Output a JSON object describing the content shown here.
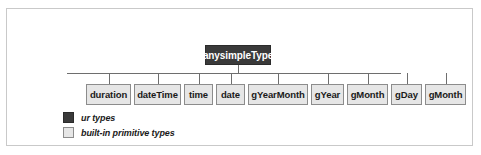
{
  "figure": {
    "frame_color": "#c9c9c9",
    "line_color": "#6e6e6e"
  },
  "tree": {
    "root": {
      "label": "anysimpleType",
      "fill": "#3a3a3a",
      "text_color": "#ffffff",
      "x": 205,
      "width": 66
    },
    "children": [
      {
        "label": "duration",
        "x": 86,
        "width": 45
      },
      {
        "label": "dateTime",
        "x": 134,
        "width": 47
      },
      {
        "label": "time",
        "x": 184,
        "width": 29
      },
      {
        "label": "date",
        "x": 216,
        "width": 29
      },
      {
        "label": "gYearMonth",
        "x": 248,
        "width": 60
      },
      {
        "label": "gYear",
        "x": 311,
        "width": 33
      },
      {
        "label": "gMonth",
        "x": 347,
        "width": 41
      },
      {
        "label": "gDay",
        "x": 391,
        "width": 31
      },
      {
        "label": "gMonth",
        "x": 425,
        "width": 41
      }
    ],
    "bus": {
      "x": 67,
      "y": 73,
      "width": 334
    },
    "fill": "#e6e6e6",
    "border": "#8c8c8c"
  },
  "legend": {
    "items": [
      {
        "label": "ur types",
        "swatch": "dark-swatch-icon"
      },
      {
        "label": "built-in primitive types",
        "swatch": "light-swatch-icon"
      }
    ]
  }
}
